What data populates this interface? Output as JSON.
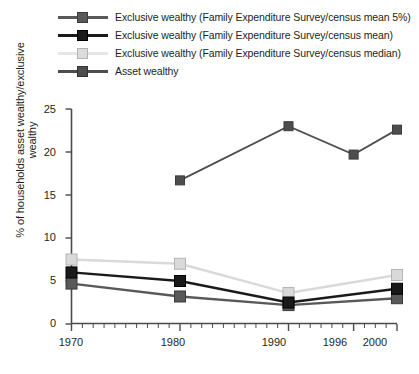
{
  "chart_data": {
    "type": "line",
    "title": "",
    "xlabel": "",
    "ylabel": "% of households asset wealthy/exclusive wealthy",
    "categories": [
      "1970",
      "1980",
      "1990",
      "1996",
      "2000"
    ],
    "x": [
      1970,
      1980,
      1990,
      1996,
      2000
    ],
    "xlim": [
      1970,
      2000
    ],
    "ylim": [
      0,
      25
    ],
    "yticks": [
      "0",
      "5",
      "10",
      "15",
      "20",
      "25"
    ],
    "ytick_values": [
      0,
      5,
      10,
      15,
      20,
      25
    ],
    "xticks": [
      "1970",
      "1980",
      "1990",
      "1996",
      "2000"
    ],
    "grid": false,
    "legend_position": "top-left",
    "minor_ticks_x": true,
    "series": [
      {
        "name": "Exclusive wealthy (Family Expenditure Survey/census mean 5%)",
        "color": "#595959",
        "marker": "square",
        "x": [
          1970,
          1980,
          1990,
          2000
        ],
        "values": [
          4.7,
          3.2,
          2.2,
          3.0
        ]
      },
      {
        "name": "Exclusive wealthy (Family Expenditure Survey/census mean)",
        "color": "#1a1a1a",
        "marker": "square",
        "x": [
          1970,
          1980,
          1990,
          2000
        ],
        "values": [
          6.0,
          5.0,
          2.5,
          4.1
        ]
      },
      {
        "name": "Exclusive wealthy (Family Expenditure Survey/census median)",
        "color": "#d9d9d9",
        "marker": "square",
        "x": [
          1970,
          1980,
          1990,
          2000
        ],
        "values": [
          7.5,
          7.0,
          3.6,
          5.7
        ]
      },
      {
        "name": "Asset wealthy",
        "color": "#4d4d4d",
        "marker": "square",
        "x": [
          1980,
          1990,
          1996,
          2000
        ],
        "values": [
          16.7,
          23.0,
          19.7,
          22.6
        ]
      }
    ]
  },
  "legend": {
    "items": [
      {
        "label": "Exclusive wealthy (Family Expenditure Survey/census mean 5%)",
        "color": "#595959",
        "marker_fill": "#595959",
        "marker_border": "#3b3b3b"
      },
      {
        "label": "Exclusive wealthy (Family Expenditure Survey/census mean)",
        "color": "#1a1a1a",
        "marker_fill": "#1a1a1a",
        "marker_border": "#000000"
      },
      {
        "label": "Exclusive wealthy (Family Expenditure Survey/census median)",
        "color": "#e2e2e2",
        "marker_fill": "#dcdcdc",
        "marker_border": "#b4b4b4"
      },
      {
        "label": "Asset wealthy",
        "color": "#4d4d4d",
        "marker_fill": "#4d4d4d",
        "marker_border": "#333333"
      }
    ]
  },
  "axes": {
    "ylabel": "% of households asset wealthy/exclusive wealthy",
    "ytick_labels": [
      "25",
      "20",
      "15",
      "10",
      "5",
      "0"
    ],
    "xtick_labels": [
      "1970",
      "1980",
      "1990",
      "1996",
      "2000"
    ],
    "axis_color": "#4a4a4a"
  }
}
